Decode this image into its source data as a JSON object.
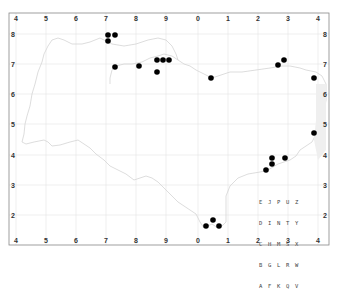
{
  "map": {
    "frame": {
      "left": 9,
      "top": 13,
      "right": 329,
      "bottom": 245
    },
    "x_ticks": [
      {
        "label": "4",
        "x": 16
      },
      {
        "label": "5",
        "x": 46
      },
      {
        "label": "6",
        "x": 76
      },
      {
        "label": "7",
        "x": 106
      },
      {
        "label": "8",
        "x": 136
      },
      {
        "label": "9",
        "x": 166
      },
      {
        "label": "0",
        "x": 198
      },
      {
        "label": "1",
        "x": 228
      },
      {
        "label": "2",
        "x": 258
      },
      {
        "label": "3",
        "x": 288
      },
      {
        "label": "4",
        "x": 318
      }
    ],
    "y_ticks": [
      {
        "label": "8",
        "y": 34
      },
      {
        "label": "7",
        "y": 64
      },
      {
        "label": "6",
        "y": 94
      },
      {
        "label": "5",
        "y": 124
      },
      {
        "label": "4",
        "y": 155
      },
      {
        "label": "3",
        "y": 185
      },
      {
        "label": "2",
        "y": 215
      }
    ],
    "points": [
      {
        "x": 108,
        "y": 35
      },
      {
        "x": 115,
        "y": 35
      },
      {
        "x": 108,
        "y": 41
      },
      {
        "x": 115,
        "y": 67
      },
      {
        "x": 139,
        "y": 66
      },
      {
        "x": 157,
        "y": 60
      },
      {
        "x": 163,
        "y": 60
      },
      {
        "x": 169,
        "y": 60
      },
      {
        "x": 157,
        "y": 72
      },
      {
        "x": 211,
        "y": 78
      },
      {
        "x": 278,
        "y": 65
      },
      {
        "x": 284,
        "y": 60
      },
      {
        "x": 314,
        "y": 78
      },
      {
        "x": 314,
        "y": 133
      },
      {
        "x": 272,
        "y": 158
      },
      {
        "x": 272,
        "y": 164
      },
      {
        "x": 285,
        "y": 158
      },
      {
        "x": 266,
        "y": 170
      },
      {
        "x": 206,
        "y": 226
      },
      {
        "x": 213,
        "y": 220
      },
      {
        "x": 219,
        "y": 226
      }
    ],
    "point_color": "#000000",
    "coastline_color": "#cfcfcf",
    "grid_color": "#e4e4e4",
    "legend_grid": [
      "E J P U Z",
      "D I N T Y",
      "C H M S X",
      "B G L R W",
      "A F K Q V"
    ]
  }
}
